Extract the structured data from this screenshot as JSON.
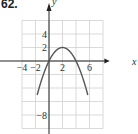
{
  "problem_number": "62.",
  "chart_data": {
    "type": "line",
    "title": "",
    "xlabel": "x",
    "ylabel": "y",
    "xlim": [
      -5,
      9
    ],
    "ylim": [
      -11,
      7
    ],
    "grid": true,
    "x_tick_labels": [
      "-4",
      "-2",
      "2",
      "6"
    ],
    "x_ticks": [
      -4,
      -2,
      2,
      6
    ],
    "y_tick_labels": [
      "4",
      "2",
      "-8"
    ],
    "y_ticks": [
      4,
      2,
      -8
    ],
    "series": [
      {
        "name": "f(x) = -0.5x^2 + 2x",
        "equation": "y = -(1/2)(x-2)^2 + 2",
        "vertex": [
          2,
          2
        ],
        "x": [
          -1.5,
          -1,
          0,
          1,
          2,
          3,
          4,
          5,
          5.5
        ],
        "y": [
          -4.125,
          -2.5,
          0,
          1.5,
          2,
          1.5,
          0,
          -2.5,
          -4.125
        ]
      }
    ],
    "colors": {
      "curve": "#555555",
      "axis": "#222222",
      "grid": "#d0d0d0"
    }
  }
}
